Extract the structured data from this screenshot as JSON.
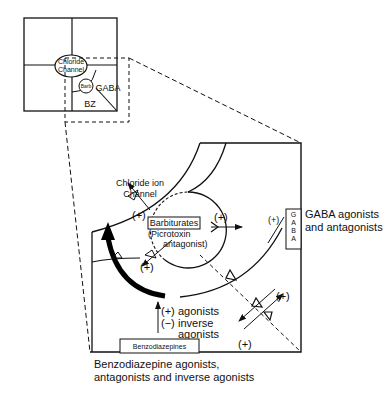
{
  "inset": {
    "chloride_channel_line1": "Chloride",
    "chloride_channel_line2": "Channel",
    "gaba": "GABA",
    "barb": "Barb",
    "bz": "BZ"
  },
  "main": {
    "chloride_ion_channel_line1": "Chloride ion",
    "chloride_ion_channel_line2": "Channel",
    "barbiturates": "Barbiturates",
    "picrotoxin_line1": "(Picrotoxin",
    "picrotoxin_line2": "antagonist)",
    "plus_left": "(+)",
    "plus_right": "(+)",
    "plus_below_circle": "(+)",
    "plus_gaba": "(+)",
    "gaba_box_letters": [
      "G",
      "A",
      "B",
      "A"
    ],
    "gaba_agonists_line1": "GABA agonists",
    "gaba_agonists_line2": "and antagonists",
    "agonists_plus": "(+)",
    "agonists_label": "agonists",
    "inverse_minus": "(−)",
    "inverse_label": "inverse",
    "inverse_label2": "agonists",
    "plus_lower_right_top": "(+)",
    "plus_lower_right_bottom": "(+)",
    "benzodiazepines_box": "Benzodiazepines",
    "bz_caption_line1": "Benzodiazepine agonists,",
    "bz_caption_line2": "antagonists and inverse agonists"
  }
}
